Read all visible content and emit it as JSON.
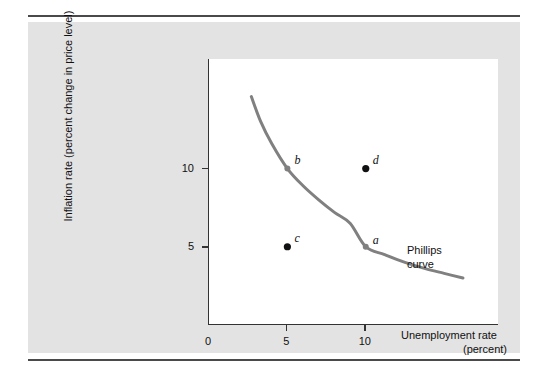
{
  "figure": {
    "background_color": "#ffffff",
    "panel_color": "#e3e3e3",
    "plot_background": "#ffffff",
    "rule_color": "#4a4a4a",
    "axis_color": "#333333"
  },
  "chart_data": {
    "type": "line",
    "title": "",
    "subtitle": "",
    "xlabel_line1": "Unemployment rate",
    "xlabel_line2": "(percent)",
    "ylabel": "Inflation rate (percent change in price level)",
    "xlim": [
      0,
      18.5
    ],
    "ylim": [
      0,
      17
    ],
    "xticks": [
      0,
      5,
      10
    ],
    "xtick_labels": [
      "0",
      "5",
      "10"
    ],
    "yticks": [
      5,
      10
    ],
    "ytick_labels": [
      "5",
      "10"
    ],
    "grid": false,
    "legend_position": "none",
    "series": [
      {
        "name": "Phillips curve",
        "color": "#808080",
        "line_width": 3,
        "x": [
          2.7,
          3.3,
          4.0,
          5.0,
          6.0,
          7.0,
          8.0,
          9.0,
          10.0,
          11.2,
          12.5,
          13.8,
          15.0,
          16.2
        ],
        "y": [
          14.6,
          13.0,
          11.6,
          10.0,
          8.9,
          8.0,
          7.2,
          6.5,
          5.0,
          4.5,
          4.0,
          3.6,
          3.3,
          3.0
        ]
      }
    ],
    "annotations": [
      {
        "name": "curve-label",
        "text_line1": "Phillips",
        "text_line2": "curve",
        "x": 13.0,
        "y": 4.9
      }
    ],
    "points": [
      {
        "label": "a",
        "x": 10.0,
        "y": 5.0,
        "color": "#808080",
        "on_curve": true,
        "label_dx": 8,
        "label_dy": -14
      },
      {
        "label": "b",
        "x": 5.0,
        "y": 10.0,
        "color": "#808080",
        "on_curve": true,
        "label_dx": 8,
        "label_dy": -16
      },
      {
        "label": "c",
        "x": 5.0,
        "y": 5.0,
        "color": "#111111",
        "on_curve": false,
        "label_dx": 8,
        "label_dy": -16
      },
      {
        "label": "d",
        "x": 10.0,
        "y": 10.0,
        "color": "#111111",
        "on_curve": false,
        "label_dx": 8,
        "label_dy": -16
      }
    ]
  }
}
